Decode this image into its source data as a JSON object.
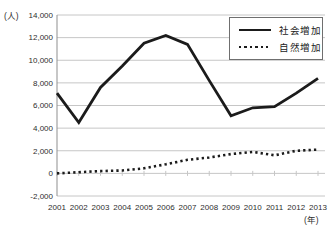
{
  "figure": {
    "y_unit_label": "(人)",
    "x_unit_label": "(年)"
  },
  "legend": {
    "items": [
      {
        "label": "社会増加",
        "style": "solid"
      },
      {
        "label": "自然増加",
        "style": "dotted"
      }
    ]
  },
  "chart_data": {
    "type": "line",
    "title": "",
    "x": [
      "2001",
      "2002",
      "2003",
      "2004",
      "2005",
      "2006",
      "2007",
      "2008",
      "2009",
      "2010",
      "2011",
      "2012",
      "2013"
    ],
    "xlabel": "(年)",
    "ylabel": "(人)",
    "ylim": [
      -2000,
      14000
    ],
    "ytick_step": 2000,
    "ytick_labels": [
      "-2,000",
      "0",
      "2,000",
      "4,000",
      "6,000",
      "8,000",
      "10,000",
      "12,000",
      "14,000"
    ],
    "grid": true,
    "legend_position": "top-right",
    "series": [
      {
        "id": "social-increase",
        "name": "社会増加",
        "style": "solid",
        "values": [
          7100,
          4500,
          7600,
          9500,
          11500,
          12200,
          11400,
          8200,
          5100,
          5800,
          5900,
          7100,
          8400
        ]
      },
      {
        "id": "natural-increase",
        "name": "自然増加",
        "style": "dotted",
        "values": [
          0,
          100,
          200,
          250,
          450,
          800,
          1200,
          1400,
          1700,
          1900,
          1600,
          2000,
          2100
        ]
      }
    ],
    "colors": {
      "line": "#1b1b1b",
      "grid": "#c6c6c6",
      "axis": "#8f8f8f",
      "text": "#2e2e2e",
      "background": "#ffffff"
    }
  }
}
